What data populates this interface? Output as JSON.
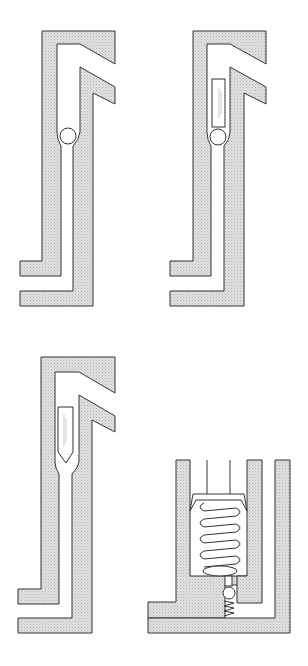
{
  "diagram": {
    "title": "",
    "colors": {
      "wall_fill": "#d8d8d8",
      "line": "#333333",
      "background": "#ffffff"
    },
    "figures": [
      {
        "id": "a",
        "label": "",
        "element": "ball check valve"
      },
      {
        "id": "b",
        "label": "",
        "element": "ball with cylindrical retainer"
      },
      {
        "id": "c",
        "label": "",
        "element": "pointed needle plug"
      },
      {
        "id": "d",
        "label": "",
        "element": "spring-loaded piston with ball check"
      }
    ]
  }
}
